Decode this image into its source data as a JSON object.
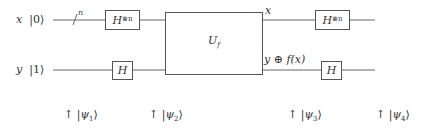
{
  "circuit": {
    "inputs": [
      {
        "register": "x",
        "ket": "|0⟩",
        "ket_value": "0"
      },
      {
        "register": "y",
        "ket": "|1⟩",
        "ket_value": "1"
      }
    ],
    "bus_label": "n",
    "gates": {
      "h_n_left": {
        "base": "H",
        "sup": "⊗n"
      },
      "h_left": {
        "base": "H"
      },
      "oracle": {
        "base": "U",
        "sub": "f"
      },
      "h_n_right": {
        "base": "H",
        "sup": "⊗n"
      },
      "h_right": {
        "base": "H"
      }
    },
    "outputs": {
      "top": "x",
      "bottom": "y ⊕ f(x)"
    },
    "states": [
      {
        "arrow": "↑",
        "psi": "ψ",
        "index": "1"
      },
      {
        "arrow": "↑",
        "psi": "ψ",
        "index": "2"
      },
      {
        "arrow": "↑",
        "psi": "ψ",
        "index": "3"
      },
      {
        "arrow": "↑",
        "psi": "ψ",
        "index": "4"
      }
    ],
    "colors": {
      "line": "#666666",
      "text": "#333333",
      "background": "#ffffff"
    }
  }
}
